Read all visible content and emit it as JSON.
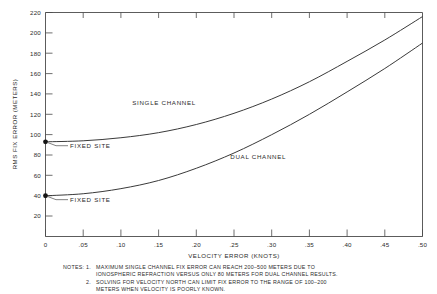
{
  "chart_data": {
    "type": "line",
    "title": "",
    "xlabel": "VELOCITY ERROR (KNOTS)",
    "ylabel": "RMS FIX ERROR (METERS)",
    "xlim": [
      0,
      0.5
    ],
    "ylim": [
      0,
      220
    ],
    "grid": false,
    "legend": "inline-curve-labels",
    "xticks": [
      0,
      0.05,
      0.1,
      0.15,
      0.2,
      0.25,
      0.3,
      0.35,
      0.4,
      0.45,
      0.5
    ],
    "xtick_labels": [
      "0",
      ".05",
      ".10",
      ".15",
      ".20",
      ".25",
      ".30",
      ".35",
      ".40",
      ".45",
      ".50"
    ],
    "yticks": [
      20,
      40,
      60,
      80,
      100,
      120,
      140,
      160,
      180,
      200,
      220
    ],
    "ytick_labels": [
      "20",
      "40",
      "60",
      "80",
      "100",
      "120",
      "140",
      "160",
      "180",
      "200",
      "220"
    ],
    "series": [
      {
        "name": "SINGLE CHANNEL",
        "x": [
          0.0,
          0.05,
          0.1,
          0.15,
          0.2,
          0.25,
          0.3,
          0.35,
          0.4,
          0.45,
          0.5
        ],
        "values": [
          93,
          94,
          97,
          102,
          110,
          121,
          135,
          152,
          172,
          193,
          216
        ]
      },
      {
        "name": "DUAL CHANNEL",
        "x": [
          0.0,
          0.05,
          0.1,
          0.15,
          0.2,
          0.25,
          0.3,
          0.35,
          0.4,
          0.45,
          0.5
        ],
        "values": [
          40,
          42,
          47,
          55,
          67,
          82,
          100,
          120,
          142,
          165,
          190
        ]
      }
    ],
    "annotations": [
      {
        "label": "FIXED SITE",
        "x": 0.0,
        "y": 93,
        "series": "SINGLE CHANNEL"
      },
      {
        "label": "FIXED SITE",
        "x": 0.0,
        "y": 40,
        "series": "DUAL CHANNEL"
      }
    ],
    "curve_labels": [
      {
        "text": "SINGLE CHANNEL",
        "x": 0.115,
        "y": 129
      },
      {
        "text": "DUAL CHANNEL",
        "x": 0.245,
        "y": 76
      }
    ]
  },
  "notes": {
    "heading": "NOTES:",
    "items": [
      {
        "number": "1.",
        "lines": [
          "MAXIMUM SINGLE CHANNEL FIX ERROR CAN REACH 200–500 METERS DUE TO",
          "IONOSPHERIC REFRACTION VERSUS ONLY 80 METERS FOR DUAL CHANNEL RESULTS."
        ]
      },
      {
        "number": "2.",
        "lines": [
          "SOLVING FOR VELOCITY NORTH CAN LIMIT FIX ERROR TO THE RANGE OF 100–200",
          "METERS WHEN VELOCITY IS POORLY KNOWN."
        ]
      }
    ]
  },
  "colors": {
    "background": "#ffffff",
    "axis": "#4a4a4a",
    "curve": "#3a3a3a",
    "text": "#2b2b2b",
    "marker": "#151515"
  }
}
